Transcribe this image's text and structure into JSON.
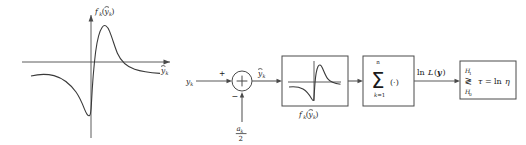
{
  "figure": {
    "colors": {
      "background": "#ffffff",
      "axis": "#4a4a4a",
      "curve": "#3a3a3a",
      "line": "#5a5a5a",
      "text": "#1a1a1a"
    }
  },
  "plot": {
    "name": "nonlinearity-plot",
    "yaxis_label": "f",
    "yaxis_label_sub": "k",
    "yaxis_label_arg_open": "(",
    "yaxis_label_arg": "y",
    "yaxis_label_arg_sub": "k",
    "yaxis_label_arg_close": ")",
    "yaxis_label_full": "f_k(ỹ_k)",
    "xaxis_label": "y",
    "xaxis_label_sub": "k",
    "xaxis_label_full": "ỹ_k",
    "description": "Odd-symmetric S-shaped nonlinearity with positive peak right of origin and negative trough left of origin, decaying tails"
  },
  "diagram": {
    "input": {
      "name": "input-signal",
      "label": "y",
      "label_sub": "k",
      "label_full": "y_k"
    },
    "summing_junction": {
      "name": "summing-junction",
      "operator": "+",
      "plus_sign": "+",
      "minus_sign": "−",
      "output_label": "y",
      "output_label_sub": "k",
      "output_label_full": "ỹ_k"
    },
    "bias_input": {
      "name": "bias-input",
      "numerator": "a",
      "numerator_sub": "k",
      "denominator": "2",
      "label_full": "a_k / 2"
    },
    "nonlinearity_block": {
      "name": "nonlinearity-block",
      "caption": "f",
      "caption_sub": "k",
      "caption_open": "(",
      "caption_arg": "y",
      "caption_arg_sub": "k",
      "caption_close": ")",
      "caption_full": "f_k(ỹ_k)"
    },
    "summation_block": {
      "name": "summation-block",
      "symbol": "Σ",
      "upper_limit": "n",
      "lower_limit": "k=1",
      "lower_limit_var": "k",
      "lower_limit_eq": "=1",
      "operand": "(·)",
      "label_full": "sum k=1 to n of (.)"
    },
    "likelihood_signal": {
      "name": "log-likelihood-signal",
      "ln": "ln",
      "L": "L",
      "open": "(",
      "vector": "y",
      "close": ")",
      "label_full": "ln L(y)"
    },
    "decision_block": {
      "name": "decision-block",
      "hypothesis_upper": "H",
      "hypothesis_upper_sub": "1",
      "hypothesis_lower": "H",
      "hypothesis_lower_sub": "0",
      "compare_symbol": "≷",
      "threshold": "τ",
      "equals": "=",
      "threshold_rhs_ln": "ln",
      "threshold_rhs_eta": "η",
      "threshold_full": "τ = ln η",
      "label_full": "H1/H0 threshold test tau = ln eta"
    }
  }
}
